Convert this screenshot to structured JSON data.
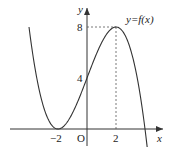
{
  "chart_data": {
    "type": "line",
    "title": "",
    "function_label": "y=f(x)",
    "xlabel": "x",
    "ylabel": "y",
    "origin_label": "O",
    "x_ticks": [
      {
        "value": -2,
        "label": "−2"
      },
      {
        "value": 2,
        "label": "2"
      }
    ],
    "y_ticks": [
      {
        "value": 4,
        "label": "4"
      },
      {
        "value": 8,
        "label": "8"
      }
    ],
    "key_points": [
      {
        "x": -2,
        "y": 0,
        "note": "local minimum, tangent to x-axis"
      },
      {
        "x": 0,
        "y": 4,
        "note": "y-intercept"
      },
      {
        "x": 2,
        "y": 8,
        "note": "local maximum, dashed guides to axes"
      },
      {
        "x": 4,
        "y": 0,
        "note": "x-intercept"
      }
    ],
    "curve_formula": "f(x) = -1/4 (x+2)^2 (x-4)",
    "x_range": [
      -4,
      4.4
    ],
    "grid": false,
    "legend": "none",
    "colors": {
      "curve": "#333333",
      "axes": "#333333",
      "dashed": "#555555"
    }
  }
}
